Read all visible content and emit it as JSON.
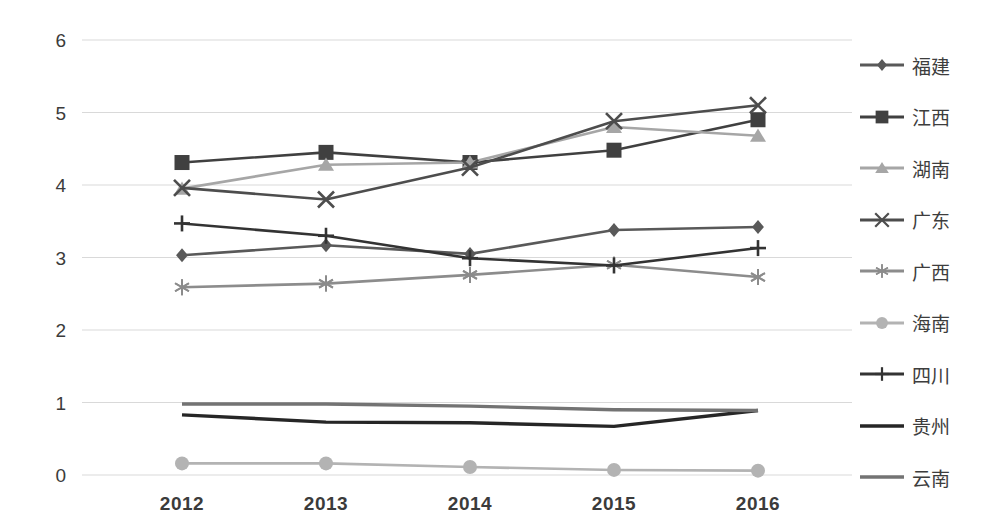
{
  "chart_data": {
    "type": "line",
    "title": "",
    "xlabel": "",
    "ylabel": "",
    "categories": [
      "2012",
      "2013",
      "2014",
      "2015",
      "2016"
    ],
    "ylim": [
      0,
      6
    ],
    "ytick_step": 1,
    "yticks": [
      "0",
      "1",
      "2",
      "3",
      "4",
      "5",
      "6"
    ],
    "grid": true,
    "grid_axis": "y",
    "legend_position": "right",
    "series": [
      {
        "name": "福建",
        "marker": "diamond",
        "color": "#595959",
        "values": [
          3.03,
          3.17,
          3.05,
          3.38,
          3.42
        ]
      },
      {
        "name": "江西",
        "marker": "square",
        "color": "#404040",
        "values": [
          4.31,
          4.45,
          4.31,
          4.48,
          4.9
        ]
      },
      {
        "name": "湖南",
        "marker": "triangle",
        "color": "#a6a6a6",
        "values": [
          3.95,
          4.28,
          4.31,
          4.8,
          4.68
        ]
      },
      {
        "name": "广东",
        "marker": "x",
        "color": "#4d4d4d",
        "values": [
          3.96,
          3.8,
          4.24,
          4.88,
          5.1
        ]
      },
      {
        "name": "广西",
        "marker": "asterisk",
        "color": "#8c8c8c",
        "values": [
          2.59,
          2.64,
          2.76,
          2.9,
          2.73
        ]
      },
      {
        "name": "海南",
        "marker": "circle",
        "color": "#b3b3b3",
        "values": [
          0.16,
          0.16,
          0.11,
          0.07,
          0.06
        ]
      },
      {
        "name": "四川",
        "marker": "plus",
        "color": "#333333",
        "values": [
          3.47,
          3.3,
          2.99,
          2.89,
          3.13
        ]
      },
      {
        "name": "贵州",
        "marker": "none",
        "color": "#262626",
        "values": [
          0.83,
          0.73,
          0.72,
          0.67,
          0.89
        ]
      },
      {
        "name": "云南",
        "marker": "none",
        "color": "#737373",
        "values": [
          0.98,
          0.98,
          0.95,
          0.9,
          0.89
        ]
      }
    ]
  },
  "axis": {
    "y_ticks": [
      "6",
      "5",
      "4",
      "3",
      "2",
      "1",
      "0"
    ],
    "x_ticks": [
      "2012",
      "2013",
      "2014",
      "2015",
      "2016"
    ]
  },
  "legend": {
    "items": [
      {
        "label": "福建"
      },
      {
        "label": "江西"
      },
      {
        "label": "湖南"
      },
      {
        "label": "广东"
      },
      {
        "label": "广西"
      },
      {
        "label": "海南"
      },
      {
        "label": "四川"
      },
      {
        "label": "贵州"
      },
      {
        "label": "云南"
      }
    ]
  },
  "colors": {
    "grid": "#d9d9d9",
    "text": "#3b3b3b",
    "background": "#ffffff"
  }
}
